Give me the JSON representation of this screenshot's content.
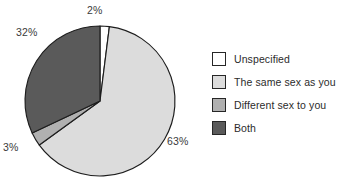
{
  "chart_data": {
    "type": "pie",
    "title": "",
    "subtitle": "",
    "xlabel": "",
    "ylabel": "",
    "grid": false,
    "legend_position": "right",
    "start_angle_deg": 0,
    "direction": "clockwise",
    "categories": [
      "Unspecified",
      "The same sex as you",
      "Different sex to you",
      "Both"
    ],
    "values": [
      2,
      63,
      3,
      32
    ],
    "value_unit": "%",
    "data_labels": [
      "2%",
      "63%",
      "3%",
      "32%"
    ],
    "colors": [
      "#ffffff",
      "#dcdcdc",
      "#b0b0b0",
      "#5a5a5a"
    ],
    "edge_color": "#1d1d1d",
    "slices": [
      {
        "label": "Unspecified",
        "value": 2,
        "display": "2%",
        "color": "#ffffff"
      },
      {
        "label": "The same sex as you",
        "value": 63,
        "display": "63%",
        "color": "#dcdcdc"
      },
      {
        "label": "Different sex to you",
        "value": 3,
        "display": "3%",
        "color": "#b0b0b0"
      },
      {
        "label": "Both",
        "value": 32,
        "display": "32%",
        "color": "#5a5a5a"
      }
    ]
  },
  "callouts": {
    "unspecified": "2%",
    "both": "32%",
    "different": "3%",
    "same": "63%"
  },
  "legend": {
    "items": [
      {
        "label": "Unspecified",
        "color": "#ffffff"
      },
      {
        "label": "The same sex as you",
        "color": "#dcdcdc"
      },
      {
        "label": "Different sex to you",
        "color": "#b0b0b0"
      },
      {
        "label": "Both",
        "color": "#5a5a5a"
      }
    ]
  }
}
